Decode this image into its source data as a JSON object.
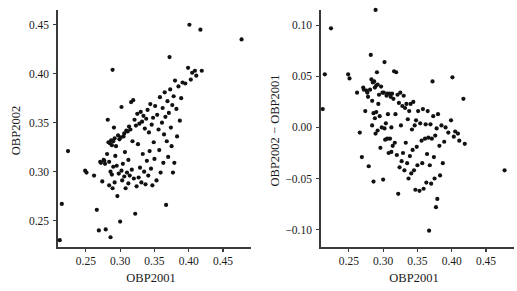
{
  "figure": {
    "background": "#ffffff",
    "point_color": "#111111",
    "axis_color": "#3a3a3a",
    "panel_count": 2
  },
  "caption": {
    "clipped_text": ""
  },
  "chart_data": [
    {
      "type": "scatter",
      "panel": "left",
      "title": "",
      "xlabel": "OBP2001",
      "ylabel": "OBP2002",
      "xlim": [
        0.208,
        0.482
      ],
      "ylim": [
        0.222,
        0.462
      ],
      "xticks": [
        0.25,
        0.3,
        0.35,
        0.4,
        0.45
      ],
      "xtick_labels": [
        "0.25",
        "0.30",
        "0.35",
        "0.40",
        "0.45"
      ],
      "yticks": [
        0.25,
        0.3,
        0.35,
        0.4,
        0.45
      ],
      "ytick_labels": [
        "0.25",
        "0.30",
        "0.35",
        "0.40",
        "0.45"
      ],
      "grid": false,
      "legend": false,
      "marker": "circle",
      "marker_size": 2.1,
      "x": [
        0.212,
        0.215,
        0.224,
        0.249,
        0.251,
        0.262,
        0.266,
        0.269,
        0.271,
        0.272,
        0.274,
        0.276,
        0.277,
        0.278,
        0.279,
        0.281,
        0.282,
        0.283,
        0.284,
        0.284,
        0.285,
        0.286,
        0.286,
        0.287,
        0.288,
        0.288,
        0.289,
        0.289,
        0.29,
        0.29,
        0.291,
        0.292,
        0.292,
        0.293,
        0.294,
        0.295,
        0.296,
        0.297,
        0.298,
        0.299,
        0.3,
        0.301,
        0.302,
        0.302,
        0.303,
        0.304,
        0.305,
        0.306,
        0.306,
        0.307,
        0.308,
        0.309,
        0.31,
        0.311,
        0.312,
        0.312,
        0.313,
        0.314,
        0.315,
        0.316,
        0.317,
        0.318,
        0.319,
        0.32,
        0.321,
        0.322,
        0.323,
        0.324,
        0.325,
        0.326,
        0.327,
        0.328,
        0.329,
        0.33,
        0.331,
        0.332,
        0.333,
        0.334,
        0.335,
        0.336,
        0.337,
        0.338,
        0.339,
        0.34,
        0.341,
        0.342,
        0.343,
        0.344,
        0.345,
        0.346,
        0.347,
        0.348,
        0.349,
        0.35,
        0.351,
        0.353,
        0.354,
        0.356,
        0.357,
        0.358,
        0.359,
        0.361,
        0.362,
        0.363,
        0.364,
        0.365,
        0.366,
        0.367,
        0.368,
        0.369,
        0.37,
        0.371,
        0.372,
        0.373,
        0.374,
        0.375,
        0.376,
        0.377,
        0.378,
        0.379,
        0.38,
        0.382,
        0.383,
        0.385,
        0.387,
        0.389,
        0.391,
        0.395,
        0.399,
        0.401,
        0.403,
        0.405,
        0.409,
        0.411,
        0.417,
        0.419,
        0.477
      ],
      "y": [
        0.23,
        0.267,
        0.321,
        0.301,
        0.299,
        0.296,
        0.261,
        0.24,
        0.31,
        0.309,
        0.29,
        0.312,
        0.311,
        0.308,
        0.241,
        0.318,
        0.353,
        0.33,
        0.31,
        0.286,
        0.329,
        0.233,
        0.3,
        0.332,
        0.297,
        0.327,
        0.283,
        0.404,
        0.331,
        0.305,
        0.345,
        0.334,
        0.289,
        0.316,
        0.326,
        0.306,
        0.275,
        0.337,
        0.298,
        0.333,
        0.249,
        0.335,
        0.301,
        0.366,
        0.291,
        0.308,
        0.336,
        0.295,
        0.339,
        0.32,
        0.283,
        0.342,
        0.299,
        0.341,
        0.312,
        0.288,
        0.346,
        0.296,
        0.343,
        0.371,
        0.302,
        0.331,
        0.373,
        0.293,
        0.353,
        0.257,
        0.347,
        0.285,
        0.359,
        0.328,
        0.294,
        0.349,
        0.304,
        0.361,
        0.289,
        0.351,
        0.318,
        0.357,
        0.3,
        0.344,
        0.287,
        0.354,
        0.311,
        0.363,
        0.296,
        0.34,
        0.321,
        0.369,
        0.303,
        0.348,
        0.286,
        0.355,
        0.33,
        0.313,
        0.367,
        0.291,
        0.358,
        0.343,
        0.322,
        0.376,
        0.299,
        0.35,
        0.365,
        0.309,
        0.338,
        0.381,
        0.356,
        0.266,
        0.331,
        0.372,
        0.315,
        0.36,
        0.417,
        0.384,
        0.345,
        0.326,
        0.368,
        0.299,
        0.377,
        0.309,
        0.393,
        0.364,
        0.336,
        0.387,
        0.352,
        0.375,
        0.391,
        0.39,
        0.406,
        0.45,
        0.394,
        0.401,
        0.403,
        0.398,
        0.445,
        0.403,
        0.435
      ]
    },
    {
      "type": "scatter",
      "panel": "right",
      "title": "",
      "xlabel": "OBP2001",
      "ylabel": "OBP2002 − OBP2001",
      "xlim": [
        0.208,
        0.482
      ],
      "ylim": [
        -0.118,
        0.112
      ],
      "xticks": [
        0.25,
        0.3,
        0.35,
        0.4,
        0.45
      ],
      "xtick_labels": [
        "0.25",
        "0.30",
        "0.35",
        "0.40",
        "0.45"
      ],
      "yticks": [
        -0.1,
        -0.05,
        0.0,
        0.05,
        0.1
      ],
      "ytick_labels": [
        "−0.10",
        "−0.05",
        "0.00",
        "0.05",
        "0.10"
      ],
      "grid": false,
      "legend": false,
      "marker": "circle",
      "marker_size": 2.1,
      "note": "y values are the difference OBP2002 minus OBP2001 for the same players as the left panel",
      "x": [
        0.212,
        0.215,
        0.224,
        0.249,
        0.251,
        0.262,
        0.266,
        0.269,
        0.271,
        0.272,
        0.274,
        0.276,
        0.277,
        0.278,
        0.279,
        0.281,
        0.282,
        0.283,
        0.284,
        0.284,
        0.285,
        0.286,
        0.286,
        0.287,
        0.288,
        0.288,
        0.289,
        0.289,
        0.29,
        0.29,
        0.291,
        0.292,
        0.292,
        0.293,
        0.294,
        0.295,
        0.296,
        0.297,
        0.298,
        0.299,
        0.3,
        0.301,
        0.302,
        0.302,
        0.303,
        0.304,
        0.305,
        0.306,
        0.306,
        0.307,
        0.308,
        0.309,
        0.31,
        0.311,
        0.312,
        0.312,
        0.313,
        0.314,
        0.315,
        0.316,
        0.317,
        0.318,
        0.319,
        0.32,
        0.321,
        0.322,
        0.323,
        0.324,
        0.325,
        0.326,
        0.327,
        0.328,
        0.329,
        0.33,
        0.331,
        0.332,
        0.333,
        0.334,
        0.335,
        0.336,
        0.337,
        0.338,
        0.339,
        0.34,
        0.341,
        0.342,
        0.343,
        0.344,
        0.345,
        0.346,
        0.347,
        0.348,
        0.349,
        0.35,
        0.351,
        0.353,
        0.354,
        0.356,
        0.357,
        0.358,
        0.359,
        0.361,
        0.362,
        0.363,
        0.364,
        0.365,
        0.366,
        0.367,
        0.368,
        0.369,
        0.37,
        0.371,
        0.372,
        0.373,
        0.374,
        0.375,
        0.376,
        0.377,
        0.378,
        0.379,
        0.38,
        0.382,
        0.383,
        0.385,
        0.387,
        0.389,
        0.391,
        0.395,
        0.399,
        0.401,
        0.403,
        0.405,
        0.409,
        0.411,
        0.417,
        0.419,
        0.477
      ],
      "y": [
        0.018,
        0.052,
        0.097,
        0.052,
        0.048,
        0.034,
        -0.005,
        -0.029,
        0.039,
        0.037,
        0.016,
        0.036,
        0.034,
        0.03,
        -0.038,
        0.037,
        0.071,
        0.047,
        0.026,
        0.002,
        0.044,
        -0.053,
        0.014,
        0.045,
        0.009,
        0.039,
        -0.006,
        0.115,
        0.041,
        0.015,
        0.054,
        0.042,
        -0.003,
        0.023,
        0.032,
        0.011,
        -0.02,
        0.04,
        0.0,
        0.034,
        -0.051,
        0.034,
        -0.001,
        0.064,
        -0.012,
        0.004,
        0.031,
        -0.011,
        0.033,
        0.013,
        -0.025,
        0.033,
        -0.011,
        0.03,
        0.0,
        -0.024,
        0.033,
        -0.018,
        0.028,
        0.055,
        -0.015,
        0.013,
        0.054,
        -0.027,
        0.032,
        -0.065,
        0.024,
        -0.039,
        0.034,
        0.002,
        -0.033,
        0.021,
        -0.025,
        0.031,
        -0.042,
        0.019,
        -0.015,
        0.023,
        -0.035,
        0.008,
        -0.05,
        0.016,
        -0.028,
        0.023,
        -0.045,
        -0.002,
        -0.022,
        0.025,
        -0.042,
        0.002,
        -0.061,
        0.007,
        -0.019,
        -0.037,
        0.016,
        -0.062,
        0.004,
        -0.013,
        -0.035,
        0.018,
        -0.06,
        -0.011,
        0.003,
        -0.054,
        -0.026,
        0.016,
        -0.01,
        -0.101,
        -0.037,
        0.003,
        -0.055,
        -0.011,
        0.045,
        0.011,
        -0.029,
        -0.05,
        -0.008,
        -0.078,
        -0.001,
        -0.07,
        0.013,
        -0.018,
        -0.047,
        0.002,
        -0.035,
        -0.014,
        0.0,
        -0.005,
        0.007,
        0.049,
        -0.009,
        -0.004,
        -0.006,
        -0.013,
        0.028,
        -0.016,
        -0.042
      ]
    }
  ]
}
